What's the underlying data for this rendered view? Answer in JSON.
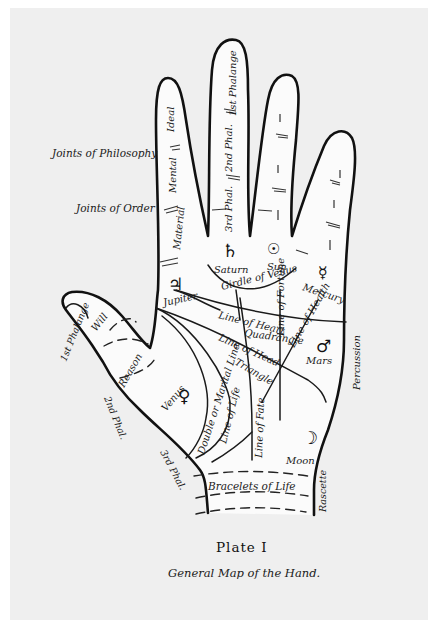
{
  "plate": {
    "title": "Plate I",
    "subtitle": "General Map of the Hand."
  },
  "side_labels": {
    "joints_philosophy": "Joints of Philosophy",
    "joints_order": "Joints of Order"
  },
  "fingers": {
    "index": {
      "ideal": "Ideal",
      "mental": "Mental",
      "material": "Material"
    },
    "middle": {
      "first": "1st Phalange",
      "second": "2nd Phal.",
      "third": "3rd Phal."
    },
    "thumb": {
      "first": "1st Phalange",
      "second": "2nd Phal.",
      "third": "3rd Phal.",
      "will": "Will",
      "reason": "Reason"
    }
  },
  "mounts": {
    "jupiter": {
      "symbol": "♃",
      "label": "Jupiter"
    },
    "saturn": {
      "symbol": "♄",
      "label": "Saturn"
    },
    "sun": {
      "symbol": "☉",
      "label": "Sun"
    },
    "mercury": {
      "symbol": "☿",
      "label": "Mercury"
    },
    "mars": {
      "symbol": "♂",
      "label": "Mars"
    },
    "venus": {
      "symbol": "♀",
      "label": "Venus"
    },
    "moon": {
      "symbol": "☽",
      "label": "Moon"
    }
  },
  "lines": {
    "girdle": "Girdle of Venus",
    "heart": "Line of Heart",
    "quadrangle": "Quadrangle",
    "fortune": "Line of Fortune",
    "health": "Line of Health",
    "head": "Line of Head",
    "triangle": "Triangle",
    "marital": "Double or Marital Line",
    "life": "Line of Life",
    "fate": "Line of Fate",
    "bracelets": "Bracelets of Life",
    "percussion": "Percussion",
    "rascette": "Rascette"
  }
}
